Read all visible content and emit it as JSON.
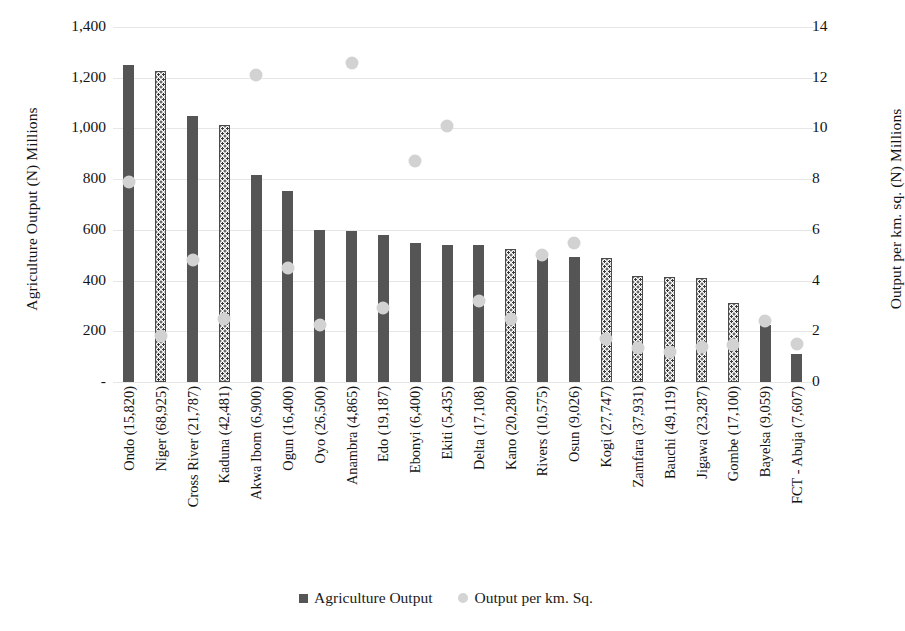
{
  "chart_data": {
    "type": "bar",
    "title": "",
    "ylabel": "Agriculture Output (N) Millions",
    "ylabel_secondary": "Output per km. sq. (N) Millions",
    "xlabel": "",
    "grid": true,
    "legend_position": "bottom",
    "ylim": [
      0,
      1400
    ],
    "ylim_secondary": [
      0,
      14
    ],
    "ytick_labels": [
      "1,400",
      "1,200",
      "1,000",
      "800",
      "600",
      "400",
      "200",
      "-"
    ],
    "ytick_values": [
      1400,
      1200,
      1000,
      800,
      600,
      400,
      200,
      0
    ],
    "ytick_labels_secondary": [
      "14",
      "12",
      "10",
      "8",
      "6",
      "4",
      "2",
      "0"
    ],
    "ytick_values_secondary": [
      14,
      12,
      10,
      8,
      6,
      4,
      2,
      0
    ],
    "categories": [
      "Ondo (15,820)",
      "Niger (68,925)",
      "Cross River (21,787)",
      "Kaduna (42,481)",
      "Akwa Ibom (6,900)",
      "Ogun (16,400)",
      "Oyo (26,500)",
      "Anambra (4,865)",
      "Edo (19,187)",
      "Ebonyi (6,400)",
      "Ekiti (5,435)",
      "Delta (17,108)",
      "Kano (20,280)",
      "Rivers (10,575)",
      "Osun (9,026)",
      "Kogi (27,747)",
      "Zamfara (37,931)",
      "Bauchi (49,119)",
      "Jigawa (23,287)",
      "Gombe (17,100)",
      "Bayelsa (9,059)",
      "FCT - Abuja (7,607)"
    ],
    "series": [
      {
        "name": "Agriculture Output",
        "axis": "left",
        "color": "#555555",
        "values": [
          1250,
          1228,
          1048,
          1015,
          815,
          752,
          600,
          595,
          580,
          550,
          542,
          540,
          525,
          490,
          492,
          490,
          418,
          415,
          412,
          312,
          225,
          110
        ],
        "fill_patterns": [
          "solid",
          "dotted",
          "solid",
          "dotted",
          "solid",
          "solid",
          "solid",
          "solid",
          "solid",
          "solid",
          "solid",
          "solid",
          "dotted",
          "solid",
          "solid",
          "dotted",
          "dotted",
          "dotted",
          "dotted",
          "dotted",
          "solid",
          "solid"
        ]
      },
      {
        "name": "Output per km. Sq.",
        "axis": "right",
        "color": "#d2d2d2",
        "values": [
          7.9,
          1.8,
          4.8,
          2.5,
          12.1,
          4.5,
          2.25,
          12.6,
          2.9,
          8.7,
          10.1,
          3.2,
          2.5,
          5.0,
          5.5,
          1.7,
          1.35,
          1.2,
          1.4,
          1.45,
          2.4,
          1.5
        ]
      }
    ],
    "legend": [
      {
        "label": "Agriculture Output",
        "marker": "square",
        "color": "#555555"
      },
      {
        "label": "Output per km. Sq.",
        "marker": "circle",
        "color": "#d4d4d4"
      }
    ]
  }
}
